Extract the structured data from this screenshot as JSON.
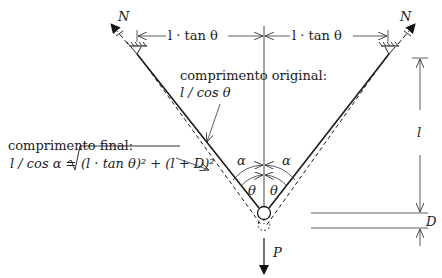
{
  "labels": {
    "force_left": "N",
    "force_right": "N",
    "dim_left": "l · tan θ",
    "dim_right": "l · tan θ",
    "original_title": "comprimento original:",
    "original_formula": "l / cos θ",
    "final_title": "comprimento final:",
    "final_formula_lhs": "l / cos α =",
    "final_formula_rhs": "(l · tan θ)² + (l + D)²",
    "angle_alpha_left": "α",
    "angle_alpha_right": "α",
    "angle_theta_left": "θ",
    "angle_theta_right": "θ",
    "load": "P",
    "dim_vertical": "l",
    "dim_deflection": "D"
  },
  "colors": {
    "line": "#1a1a1a",
    "dim": "#333333"
  }
}
